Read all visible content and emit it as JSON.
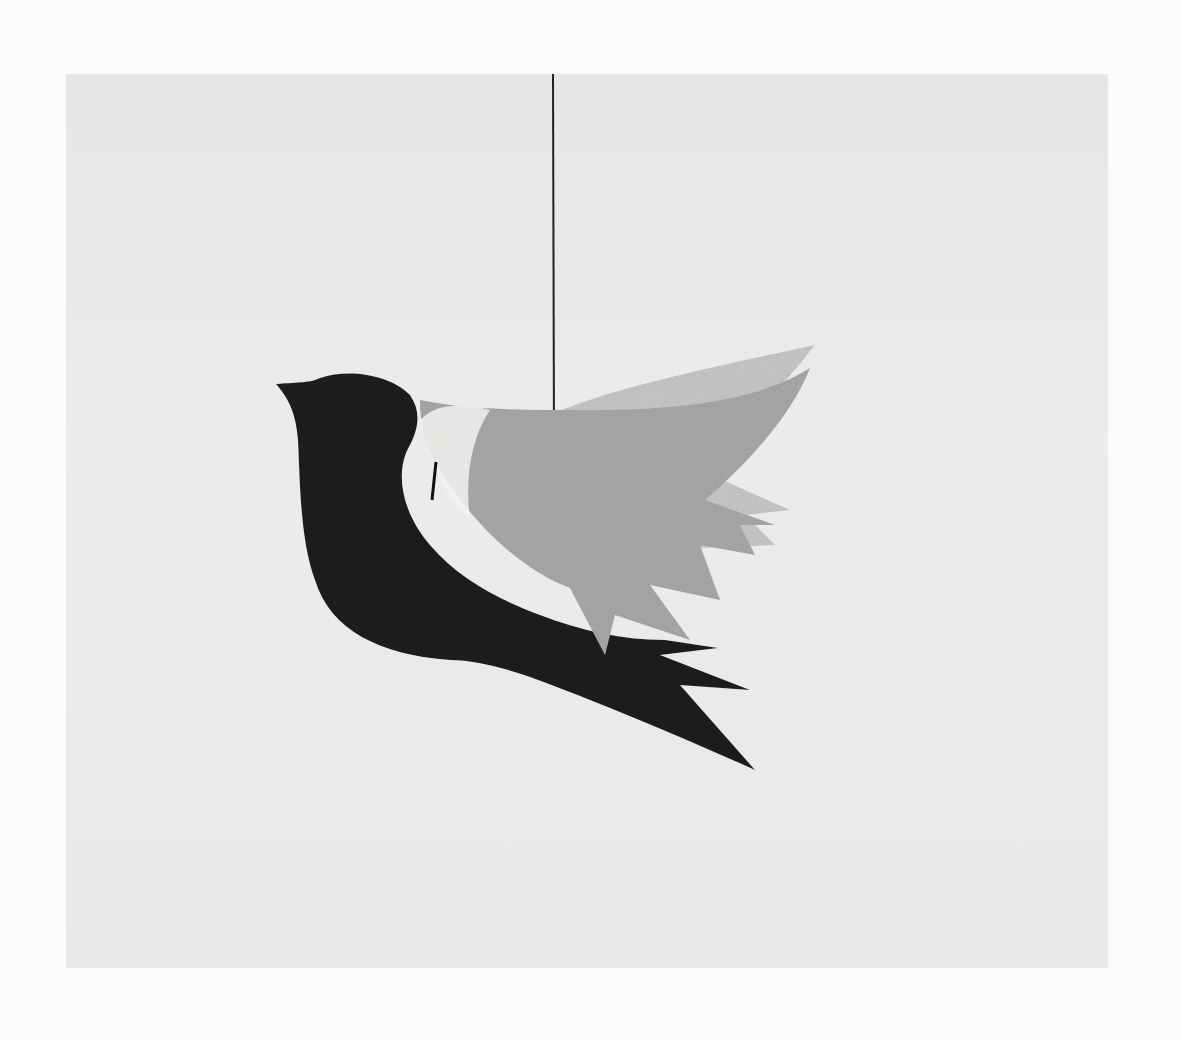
{
  "image": {
    "subject": "hanging paper dove mobile",
    "colors": {
      "page": "#fbfbfa",
      "backdrop": "#e8e8e6",
      "body": "#1c1c1c",
      "front_wing": "#a9a9a7",
      "back_wing": "#c8c8c6",
      "string": "#222222"
    }
  }
}
